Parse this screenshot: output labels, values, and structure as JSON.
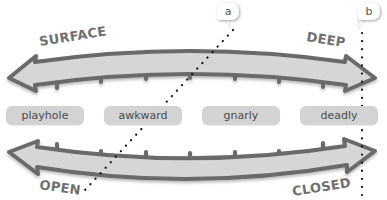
{
  "diagram": {
    "top_arrow": {
      "left_label": "SURFACE",
      "right_label": "DEEP",
      "direction": "double-headed",
      "curve": "arches-upward",
      "tick_side": "below",
      "tick_count": 7
    },
    "bottom_arrow": {
      "left_label": "OPEN",
      "right_label": "CLOSED",
      "direction": "double-headed",
      "curve": "sags-downward",
      "tick_side": "above",
      "tick_count": 7
    },
    "categories": [
      {
        "label": "playhole"
      },
      {
        "label": "awkward"
      },
      {
        "label": "gnarly"
      },
      {
        "label": "deadly"
      }
    ],
    "markers": [
      {
        "label": "a",
        "line_style": "dotted",
        "orientation": "diagonal"
      },
      {
        "label": "b",
        "line_style": "dotted",
        "orientation": "vertical"
      }
    ],
    "colors": {
      "arrow_fill": "#d6d6d6",
      "arrow_outline": "#6a6a6a",
      "label_text": "#6f6f6f",
      "pill_fill": "#d3d3d3",
      "pill_text": "#4a4a4a",
      "dots": "#111111",
      "background": "#ffffff"
    }
  }
}
